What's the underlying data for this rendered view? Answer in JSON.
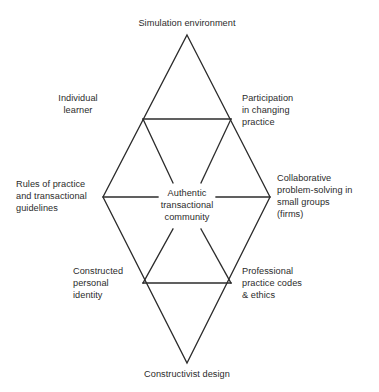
{
  "diagram": {
    "stroke_color": "#2b2b2b",
    "text_color": "#2b2b2b",
    "background_color": "#ffffff",
    "nodes": {
      "top_apex": "Simulation environment",
      "bottom_apex": "Constructivist design",
      "center": "Authentic\ntransactional\ncommunity",
      "upper_left": "Individual\nlearner",
      "upper_right": "Participation\nin changing\npractice",
      "mid_left": "Rules of practice\nand transactional\nguidelines",
      "mid_right": "Collaborative\nproblem-solving in\nsmall groups\n(firms)",
      "lower_left": "Constructed\npersonal\nidentity",
      "lower_right": "Professional\npractice codes\n& ethics"
    },
    "geometry": {
      "outer_diamond": [
        [
          187,
          35
        ],
        [
          270,
          197
        ],
        [
          187,
          363
        ],
        [
          103,
          197
        ]
      ],
      "upper_crossbar": [
        [
          143,
          119
        ],
        [
          231,
          119
        ]
      ],
      "lower_crossbar": [
        [
          143,
          283
        ],
        [
          231,
          283
        ]
      ],
      "left_spoke": [
        [
          103,
          197
        ],
        [
          158,
          197
        ]
      ],
      "right_spoke": [
        [
          216,
          197
        ],
        [
          270,
          197
        ]
      ],
      "upper_inner_left": [
        [
          143,
          119
        ],
        [
          173,
          183
        ]
      ],
      "upper_inner_right": [
        [
          231,
          119
        ],
        [
          201,
          183
        ]
      ],
      "lower_inner_left": [
        [
          173,
          229
        ],
        [
          143,
          283
        ]
      ],
      "lower_inner_right": [
        [
          201,
          229
        ],
        [
          231,
          283
        ]
      ]
    }
  }
}
